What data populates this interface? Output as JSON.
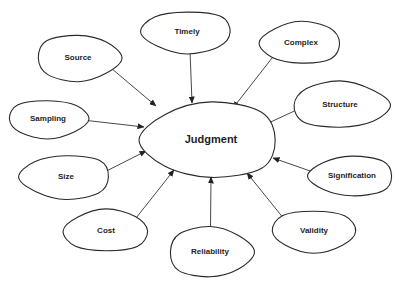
{
  "diagram": {
    "type": "concept-map",
    "center": {
      "id": "judgment",
      "label": "Judgment",
      "cx": 211,
      "cy": 140,
      "rx": 68,
      "ry": 38
    },
    "nodes": [
      {
        "id": "source",
        "label": "Source",
        "cx": 78,
        "cy": 58,
        "rx": 42,
        "ry": 23,
        "arrow_to": [
          156,
          106
        ]
      },
      {
        "id": "timely",
        "label": "Timely",
        "cx": 187,
        "cy": 32,
        "rx": 45,
        "ry": 21,
        "arrow_to": [
          192,
          103
        ]
      },
      {
        "id": "complex",
        "label": "Complex",
        "cx": 301,
        "cy": 43,
        "rx": 40,
        "ry": 21,
        "arrow_to": [
          233,
          108
        ]
      },
      {
        "id": "structure",
        "label": "Structure",
        "cx": 340,
        "cy": 105,
        "rx": 48,
        "ry": 23,
        "arrow_to": [
          262,
          126
        ]
      },
      {
        "id": "sampling",
        "label": "Sampling",
        "cx": 48,
        "cy": 119,
        "rx": 40,
        "ry": 19,
        "arrow_to": [
          144,
          127
        ]
      },
      {
        "id": "size",
        "label": "Size",
        "cx": 66,
        "cy": 177,
        "rx": 45,
        "ry": 22,
        "arrow_to": [
          146,
          151
        ]
      },
      {
        "id": "cost",
        "label": "Cost",
        "cx": 106,
        "cy": 231,
        "rx": 42,
        "ry": 21,
        "arrow_to": [
          174,
          170
        ]
      },
      {
        "id": "reliability",
        "label": "Reliability",
        "cx": 210,
        "cy": 252,
        "rx": 42,
        "ry": 25,
        "arrow_to": [
          211,
          177
        ]
      },
      {
        "id": "validity",
        "label": "Validity",
        "cx": 314,
        "cy": 231,
        "rx": 42,
        "ry": 21,
        "arrow_to": [
          247,
          173
        ]
      },
      {
        "id": "signification",
        "label": "Signification",
        "cx": 352,
        "cy": 176,
        "rx": 42,
        "ry": 20,
        "arrow_to": [
          273,
          158
        ]
      }
    ],
    "edge_direction": "peripheral-to-center",
    "colors": {
      "stroke": "#2a2a2a",
      "fill": "#ffffff",
      "text": "#1e1e1e",
      "background": "#ffffff"
    }
  }
}
